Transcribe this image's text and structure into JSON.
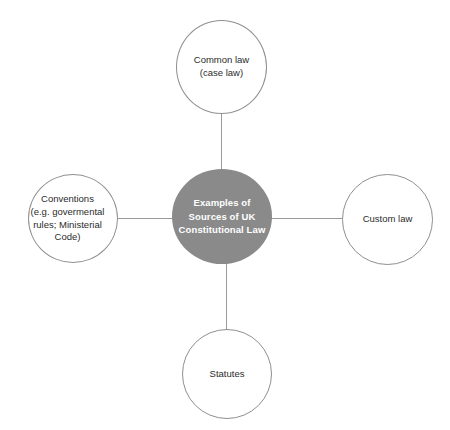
{
  "diagram": {
    "type": "hub-and-spoke",
    "center": {
      "id": "center",
      "label": "Examples of\nSources of UK\nConstitutional Law",
      "fill": "#8a8a8a",
      "text_color": "#ffffff"
    },
    "nodes": [
      {
        "id": "top",
        "position": "top",
        "label": "Common law\n(case law)",
        "fill": "#ffffff",
        "border_color": "#8f8f8f",
        "text_color": "#2b2b2b"
      },
      {
        "id": "right",
        "position": "right",
        "label": "Custom law",
        "fill": "#ffffff",
        "border_color": "#8f8f8f",
        "text_color": "#2b2b2b"
      },
      {
        "id": "bottom",
        "position": "bottom",
        "label": "Statutes",
        "fill": "#ffffff",
        "border_color": "#8f8f8f",
        "text_color": "#2b2b2b"
      },
      {
        "id": "left",
        "position": "left",
        "label": "Conventions\n(e.g. govermental\nrules; Ministerial\nCode)",
        "fill": "#ffffff",
        "border_color": "#8f8f8f",
        "text_color": "#2b2b2b"
      }
    ],
    "connectors": [
      {
        "id": "top",
        "from": "center",
        "to": "top",
        "color": "#9a9a9a"
      },
      {
        "id": "right",
        "from": "center",
        "to": "right",
        "color": "#9a9a9a"
      },
      {
        "id": "bottom",
        "from": "center",
        "to": "bottom",
        "color": "#9a9a9a"
      },
      {
        "id": "left",
        "from": "center",
        "to": "left",
        "color": "#9a9a9a"
      }
    ],
    "background": "#ffffff"
  }
}
